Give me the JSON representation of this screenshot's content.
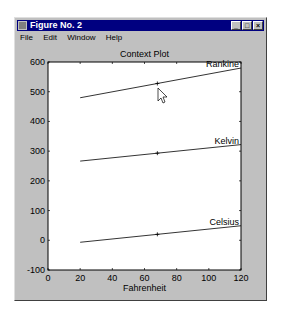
{
  "window": {
    "title": "Figure No. 2",
    "controls": {
      "minimize": "_",
      "maximize": "□",
      "close": "×"
    }
  },
  "menu": {
    "items": [
      {
        "label": "File",
        "accel": "F"
      },
      {
        "label": "Edit",
        "accel": "E"
      },
      {
        "label": "Window",
        "accel": "W"
      },
      {
        "label": "Help",
        "accel": "H"
      }
    ]
  },
  "chart_data": {
    "type": "line",
    "title": "Context Plot",
    "xlabel": "Fahrenheit",
    "ylabel": "",
    "xlim": [
      0,
      120
    ],
    "ylim": [
      -100,
      600
    ],
    "xticks": [
      0,
      20,
      40,
      60,
      80,
      100,
      120
    ],
    "yticks": [
      -100,
      0,
      100,
      200,
      300,
      400,
      500,
      600
    ],
    "grid": false,
    "legend": "none (inline text labels at right end of each line)",
    "series": [
      {
        "name": "Rankine",
        "x": [
          20,
          120
        ],
        "y": [
          479.67,
          579.67
        ],
        "marker": {
          "x": 68,
          "y": 527.67,
          "symbol": "+"
        }
      },
      {
        "name": "Kelvin",
        "x": [
          20,
          120
        ],
        "y": [
          266.48,
          322.04
        ],
        "marker": {
          "x": 68,
          "y": 293.15,
          "symbol": "+"
        }
      },
      {
        "name": "Celsius",
        "x": [
          20,
          120
        ],
        "y": [
          -6.67,
          48.89
        ],
        "marker": {
          "x": 68,
          "y": 20,
          "symbol": "+"
        }
      }
    ]
  },
  "cursor": {
    "type": "arrow-pointer"
  }
}
